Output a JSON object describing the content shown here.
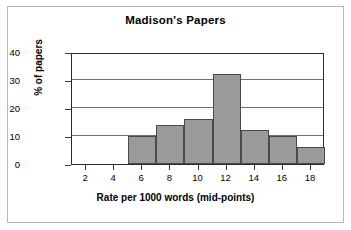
{
  "chart_data": {
    "type": "bar",
    "title": "Madison's Papers",
    "xlabel": "Rate per 1000 words (mid-points)",
    "ylabel": "% of papers",
    "categories": [
      "6",
      "8",
      "10",
      "12",
      "14",
      "16",
      "18"
    ],
    "values": [
      10,
      14,
      16,
      32,
      12,
      10,
      6
    ],
    "bin_edges": [
      5,
      7,
      9,
      11,
      13,
      15,
      17,
      19
    ],
    "x_ticks": [
      "2",
      "4",
      "6",
      "8",
      "10",
      "12",
      "14",
      "16",
      "18"
    ],
    "y_ticks": [
      "0",
      "10",
      "20",
      "30",
      "40"
    ],
    "xlim": [
      1,
      19
    ],
    "ylim": [
      0,
      40
    ],
    "grid": true,
    "legend": "none",
    "bar_fill_color": "#9a9a9a",
    "bar_edge_color": "#4a4a4a",
    "axis_color": "#2b2b2b",
    "background_color": "#ffffff"
  }
}
